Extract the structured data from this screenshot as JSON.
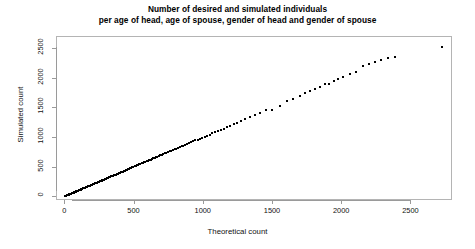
{
  "chart_data": {
    "type": "scatter",
    "title": "Number of desired and simulated individuals",
    "subtitle": "per age of head, age of spouse, gender of head and gender of spouse",
    "xlabel": "Theoretical count",
    "ylabel": "Simulated count",
    "xlim": [
      -60,
      2800
    ],
    "ylim": [
      -60,
      2700
    ],
    "xticks": [
      0,
      500,
      1000,
      1500,
      2000,
      2500
    ],
    "yticks": [
      0,
      500,
      1000,
      1500,
      2000,
      2500
    ],
    "xtick_labels": [
      "0",
      "500",
      "1000",
      "1500",
      "2000",
      "2500"
    ],
    "ytick_labels": [
      "0",
      "500",
      "1000",
      "1500",
      "2000",
      "2500"
    ],
    "grid": false,
    "legend": false,
    "marker_color": "#000000",
    "axis_color": "#9a9a9a",
    "background": "#ffffff",
    "series": [
      {
        "name": "desired vs simulated count",
        "points": [
          [
            2,
            1
          ],
          [
            5,
            4
          ],
          [
            8,
            7
          ],
          [
            11,
            10
          ],
          [
            14,
            13
          ],
          [
            17,
            16
          ],
          [
            20,
            19
          ],
          [
            24,
            22
          ],
          [
            27,
            25
          ],
          [
            30,
            29
          ],
          [
            34,
            32
          ],
          [
            37,
            36
          ],
          [
            41,
            39
          ],
          [
            44,
            43
          ],
          [
            48,
            46
          ],
          [
            52,
            50
          ],
          [
            55,
            54
          ],
          [
            59,
            57
          ],
          [
            63,
            61
          ],
          [
            67,
            65
          ],
          [
            71,
            69
          ],
          [
            75,
            73
          ],
          [
            79,
            77
          ],
          [
            83,
            81
          ],
          [
            87,
            85
          ],
          [
            91,
            89
          ],
          [
            95,
            93
          ],
          [
            100,
            98
          ],
          [
            104,
            102
          ],
          [
            108,
            106
          ],
          [
            113,
            111
          ],
          [
            117,
            115
          ],
          [
            122,
            120
          ],
          [
            126,
            124
          ],
          [
            131,
            129
          ],
          [
            136,
            134
          ],
          [
            140,
            138
          ],
          [
            145,
            143
          ],
          [
            150,
            148
          ],
          [
            155,
            153
          ],
          [
            160,
            158
          ],
          [
            165,
            163
          ],
          [
            170,
            168
          ],
          [
            175,
            173
          ],
          [
            180,
            178
          ],
          [
            185,
            183
          ],
          [
            190,
            188
          ],
          [
            196,
            194
          ],
          [
            201,
            199
          ],
          [
            206,
            204
          ],
          [
            212,
            210
          ],
          [
            217,
            215
          ],
          [
            223,
            221
          ],
          [
            228,
            226
          ],
          [
            234,
            232
          ],
          [
            240,
            238
          ],
          [
            245,
            243
          ],
          [
            251,
            249
          ],
          [
            257,
            255
          ],
          [
            263,
            261
          ],
          [
            269,
            267
          ],
          [
            275,
            273
          ],
          [
            281,
            279
          ],
          [
            287,
            285
          ],
          [
            293,
            291
          ],
          [
            299,
            297
          ],
          [
            306,
            304
          ],
          [
            312,
            310
          ],
          [
            318,
            316
          ],
          [
            325,
            323
          ],
          [
            331,
            329
          ],
          [
            338,
            336
          ],
          [
            344,
            342
          ],
          [
            351,
            349
          ],
          [
            358,
            356
          ],
          [
            365,
            363
          ],
          [
            371,
            369
          ],
          [
            378,
            376
          ],
          [
            385,
            383
          ],
          [
            392,
            390
          ],
          [
            399,
            397
          ],
          [
            407,
            405
          ],
          [
            414,
            412
          ],
          [
            421,
            419
          ],
          [
            429,
            427
          ],
          [
            436,
            434
          ],
          [
            444,
            442
          ],
          [
            451,
            449
          ],
          [
            459,
            457
          ],
          [
            467,
            465
          ],
          [
            475,
            473
          ],
          [
            483,
            481
          ],
          [
            491,
            489
          ],
          [
            499,
            497
          ],
          [
            507,
            505
          ],
          [
            515,
            513
          ],
          [
            524,
            522
          ],
          [
            532,
            530
          ],
          [
            541,
            539
          ],
          [
            549,
            547
          ],
          [
            558,
            556
          ],
          [
            567,
            565
          ],
          [
            576,
            574
          ],
          [
            585,
            583
          ],
          [
            594,
            592
          ],
          [
            604,
            602
          ],
          [
            613,
            611
          ],
          [
            623,
            621
          ],
          [
            632,
            630
          ],
          [
            642,
            640
          ],
          [
            652,
            650
          ],
          [
            662,
            660
          ],
          [
            672,
            670
          ],
          [
            683,
            681
          ],
          [
            693,
            691
          ],
          [
            704,
            702
          ],
          [
            715,
            713
          ],
          [
            726,
            724
          ],
          [
            737,
            735
          ],
          [
            748,
            746
          ],
          [
            760,
            757
          ],
          [
            772,
            769
          ],
          [
            784,
            781
          ],
          [
            796,
            793
          ],
          [
            808,
            805
          ],
          [
            821,
            818
          ],
          [
            834,
            831
          ],
          [
            847,
            844
          ],
          [
            860,
            857
          ],
          [
            874,
            870
          ],
          [
            888,
            884
          ],
          [
            902,
            898
          ],
          [
            917,
            912
          ],
          [
            932,
            927
          ],
          [
            947,
            942
          ],
          [
            963,
            957
          ],
          [
            979,
            973
          ],
          [
            996,
            989
          ],
          [
            1013,
            1006
          ],
          [
            1031,
            1023
          ],
          [
            1049,
            1041
          ],
          [
            1068,
            1060
          ],
          [
            1088,
            1079
          ],
          [
            1108,
            1099
          ],
          [
            1129,
            1120
          ],
          [
            1151,
            1142
          ],
          [
            1174,
            1165
          ],
          [
            1198,
            1189
          ],
          [
            1223,
            1214
          ],
          [
            1250,
            1241
          ],
          [
            1278,
            1270
          ],
          [
            1308,
            1300
          ],
          [
            1340,
            1333
          ],
          [
            1375,
            1369
          ],
          [
            1413,
            1408
          ],
          [
            1455,
            1451
          ],
          [
            1502,
            1460
          ],
          [
            1556,
            1520
          ],
          [
            1610,
            1600
          ],
          [
            1655,
            1648
          ],
          [
            1700,
            1694
          ],
          [
            1740,
            1736
          ],
          [
            1775,
            1772
          ],
          [
            1810,
            1808
          ],
          [
            1845,
            1846
          ],
          [
            1880,
            1884
          ],
          [
            1912,
            1900
          ],
          [
            1945,
            1940
          ],
          [
            1980,
            1978
          ],
          [
            2010,
            2005
          ],
          [
            2060,
            2060
          ],
          [
            2105,
            2100
          ],
          [
            2155,
            2190
          ],
          [
            2200,
            2230
          ],
          [
            2245,
            2265
          ],
          [
            2290,
            2290
          ],
          [
            2340,
            2330
          ],
          [
            2390,
            2350
          ],
          [
            2730,
            2520
          ]
        ]
      }
    ]
  }
}
